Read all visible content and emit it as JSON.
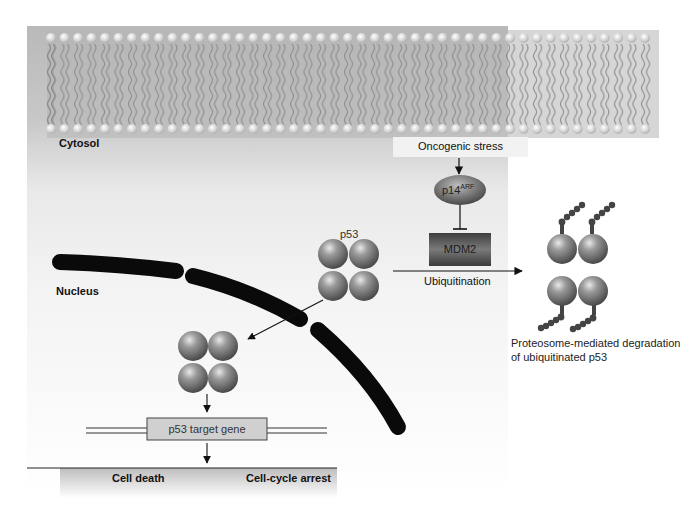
{
  "diagram": {
    "regions": {
      "cytosol": "Cytosol",
      "nucleus": "Nucleus"
    },
    "nodes": {
      "oncogenic_stress": "Oncogenic stress",
      "p14arf_base": "p14",
      "p14arf_sup": "ARF",
      "mdm2": "MDM2",
      "p53": "p53",
      "target_gene": "p53 target gene"
    },
    "edges": {
      "ubiquitination": "Ubiquitination"
    },
    "outcomes": {
      "cell_death": "Cell death",
      "cell_cycle_arrest": "Cell-cycle arrest"
    },
    "degradation_caption_line1": "Proteosome-mediated degradation",
    "degradation_caption_line2": "of ubiquitinated p53",
    "colors": {
      "membrane_bg": "#b9b9b9",
      "sphere": "#7d7d7d",
      "nuclear_envelope": "#0a0a0a",
      "mdm2_box": "#5a5a5a",
      "gene_box": "#d0d0d0"
    }
  }
}
